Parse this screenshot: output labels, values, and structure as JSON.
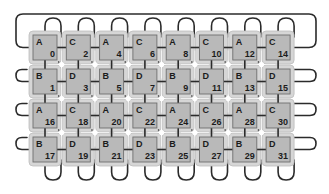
{
  "diagram": {
    "type": "torus-grid-network",
    "rows": 4,
    "cols": 8,
    "colors": {
      "wire": "#2b2b2b",
      "cell_fill": "#b9b9b9",
      "cell_border": "#6f6f6f",
      "halo": "#d6d6d6",
      "background": "#ffffff"
    },
    "cells": [
      [
        {
          "type": "A",
          "id": "0"
        },
        {
          "type": "C",
          "id": "2"
        },
        {
          "type": "A",
          "id": "4"
        },
        {
          "type": "C",
          "id": "6"
        },
        {
          "type": "A",
          "id": "8"
        },
        {
          "type": "C",
          "id": "10"
        },
        {
          "type": "A",
          "id": "12"
        },
        {
          "type": "C",
          "id": "14"
        }
      ],
      [
        {
          "type": "B",
          "id": "1"
        },
        {
          "type": "D",
          "id": "3"
        },
        {
          "type": "B",
          "id": "5"
        },
        {
          "type": "D",
          "id": "7"
        },
        {
          "type": "B",
          "id": "9"
        },
        {
          "type": "D",
          "id": "11"
        },
        {
          "type": "B",
          "id": "13"
        },
        {
          "type": "D",
          "id": "15"
        }
      ],
      [
        {
          "type": "A",
          "id": "16"
        },
        {
          "type": "C",
          "id": "18"
        },
        {
          "type": "A",
          "id": "20"
        },
        {
          "type": "C",
          "id": "22"
        },
        {
          "type": "A",
          "id": "24"
        },
        {
          "type": "C",
          "id": "26"
        },
        {
          "type": "A",
          "id": "28"
        },
        {
          "type": "C",
          "id": "30"
        }
      ],
      [
        {
          "type": "B",
          "id": "17"
        },
        {
          "type": "D",
          "id": "19"
        },
        {
          "type": "B",
          "id": "21"
        },
        {
          "type": "D",
          "id": "23"
        },
        {
          "type": "B",
          "id": "25"
        },
        {
          "type": "D",
          "id": "27"
        },
        {
          "type": "B",
          "id": "29"
        },
        {
          "type": "D",
          "id": "31"
        }
      ]
    ]
  }
}
